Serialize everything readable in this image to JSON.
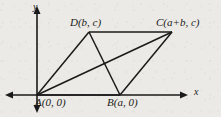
{
  "figure": {
    "type": "coordinate-geometry-diagram",
    "background_color": "#eceae6",
    "stroke_color": "#1a1a1a",
    "width": 221,
    "height": 117
  },
  "axes": {
    "x_label": "x",
    "y_label": "y",
    "origin_px": [
      37,
      95
    ],
    "x_axis": {
      "from_px": [
        5,
        95
      ],
      "to_px": [
        188,
        95
      ],
      "arrows": [
        "left",
        "right"
      ]
    },
    "y_axis": {
      "from_px": [
        37,
        8
      ],
      "to_px": [
        37,
        112
      ],
      "arrows": [
        "up",
        "down"
      ]
    }
  },
  "shape": {
    "name": "parallelogram",
    "vertices": [
      {
        "id": "A",
        "label": "A(0, 0)",
        "coords": "(0, 0)",
        "px": [
          37,
          95
        ]
      },
      {
        "id": "B",
        "label": "B(a, 0)",
        "coords": "(a, 0)",
        "px": [
          120,
          95
        ]
      },
      {
        "id": "C",
        "label": "C(a+b, c)",
        "coords": "(a+b, c)",
        "px": [
          172,
          32
        ]
      },
      {
        "id": "D",
        "label": "D(b, c)",
        "coords": "(b, c)",
        "px": [
          89,
          32
        ]
      }
    ],
    "sides": [
      "AB",
      "BC",
      "CD",
      "DA"
    ],
    "diagonals": [
      "AC",
      "BD"
    ]
  }
}
